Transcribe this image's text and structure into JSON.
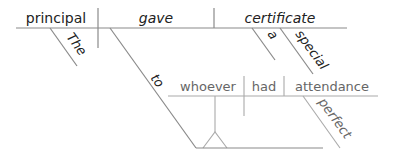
{
  "diagram": {
    "type": "Reed-Kellogg sentence diagram",
    "main_clause": {
      "subject": "principal",
      "verb": "gave",
      "direct_object": "certificate",
      "subject_modifiers": [
        "The"
      ],
      "object_modifiers": [
        "a",
        "special"
      ],
      "preposition": "to"
    },
    "noun_clause": {
      "subject": "whoever",
      "verb": "had",
      "direct_object": "attendance",
      "object_modifiers": [
        "perfect"
      ]
    },
    "colors": {
      "main_line": "#8a8a8a",
      "main_text": "#222222",
      "clause_text": "#666666",
      "clause_line": "#aaaaaa"
    }
  }
}
